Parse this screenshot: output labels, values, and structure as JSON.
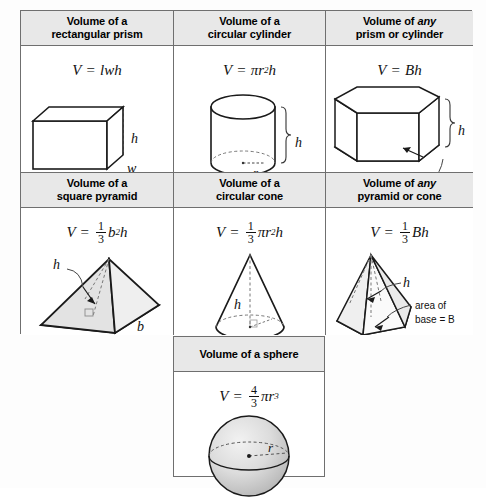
{
  "document": {
    "title": "Volume Formulas Reference Table",
    "type": "math-reference-table",
    "rows": 3,
    "columns": 3,
    "header_fill": "#e8e8e8",
    "border_color": "#6f6f6f",
    "shape_fill": "#d9d9d9"
  },
  "cells": [
    {
      "id": "rectangular-prism",
      "header_line1": "Volume of a",
      "header_line2": "rectangular prism",
      "header_italic_word": "",
      "formula_plain": "V = lwh",
      "formula": {
        "lhs": "V",
        "eq": "=",
        "rhs": "lwh"
      },
      "labels": [
        "h",
        "l",
        "w"
      ],
      "shape": "rectangular prism"
    },
    {
      "id": "circular-cylinder",
      "header_line1": "Volume of a",
      "header_line2": "circular cylinder",
      "header_italic_word": "",
      "formula_plain": "V = πr²h",
      "formula": {
        "lhs": "V",
        "eq": "=",
        "rhs": "πr²h"
      },
      "labels": [
        "h",
        "r"
      ],
      "shape": "circular cylinder"
    },
    {
      "id": "any-prism-or-cylinder",
      "header_line1": "Volume of any",
      "header_line2": "prism or cylinder",
      "header_italic_word": "any",
      "formula_plain": "V = Bh",
      "formula": {
        "lhs": "V",
        "eq": "=",
        "rhs": "Bh"
      },
      "labels": [
        "h",
        "area of base = B"
      ],
      "shape": "oblique prism"
    },
    {
      "id": "square-pyramid",
      "header_line1": "Volume of a",
      "header_line2": "square pyramid",
      "header_italic_word": "",
      "formula_plain": "V = 1/3 b²h",
      "formula": {
        "lhs": "V",
        "eq": "=",
        "frac_num": "1",
        "frac_den": "3",
        "rhs": "b²h"
      },
      "labels": [
        "h",
        "b",
        "b"
      ],
      "shape": "square pyramid"
    },
    {
      "id": "circular-cone",
      "header_line1": "Volume of a",
      "header_line2": "circular cone",
      "header_italic_word": "",
      "formula_plain": "V = 1/3 πr²h",
      "formula": {
        "lhs": "V",
        "eq": "=",
        "frac_num": "1",
        "frac_den": "3",
        "rhs": "πr²h"
      },
      "labels": [
        "h",
        "r"
      ],
      "shape": "circular cone"
    },
    {
      "id": "any-pyramid-or-cone",
      "header_line1": "Volume of any",
      "header_line2": "pyramid or cone",
      "header_italic_word": "any",
      "formula_plain": "V = 1/3 Bh",
      "formula": {
        "lhs": "V",
        "eq": "=",
        "frac_num": "1",
        "frac_den": "3",
        "rhs": "Bh"
      },
      "labels": [
        "h",
        "area of",
        "base = B"
      ],
      "shape": "hexagonal pyramid"
    },
    {
      "id": "sphere",
      "header_line1": "Volume of a sphere",
      "header_line2": "",
      "header_italic_word": "",
      "formula_plain": "V = 4/3 πr³",
      "formula": {
        "lhs": "V",
        "eq": "=",
        "frac_num": "4",
        "frac_den": "3",
        "rhs": "πr³"
      },
      "labels": [
        "r"
      ],
      "shape": "sphere"
    }
  ],
  "text": {
    "volume_of_a": "Volume of a",
    "volume_of": "Volume of",
    "any": "any",
    "rectangular_prism": "rectangular prism",
    "circular_cylinder": "circular cylinder",
    "prism_or_cylinder": "prism or cylinder",
    "square_pyramid": "square pyramid",
    "circular_cone": "circular cone",
    "pyramid_or_cone": "pyramid or cone",
    "sphere_header": "Volume of a sphere",
    "area_of_base_eq_B": "area of base = B",
    "area_of": "area of",
    "base_eq_B": "base = B",
    "V": "V",
    "eq": "=",
    "lwh": "lwh",
    "Bh": "Bh",
    "h": "h",
    "l": "l",
    "w": "w",
    "b": "b",
    "r": "r",
    "pi": "π",
    "one": "1",
    "three": "3",
    "four": "4",
    "two_exp": "2",
    "three_exp": "3"
  }
}
